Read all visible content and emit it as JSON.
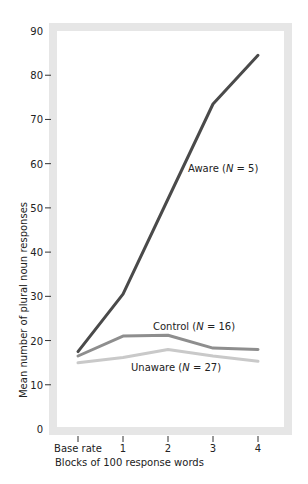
{
  "chart_data": {
    "type": "line",
    "title": "",
    "xlabel": "Blocks of 100 response words",
    "ylabel": "Mean number of plural noun responses",
    "categories": [
      "Base rate",
      "1",
      "2",
      "3",
      "4"
    ],
    "yticks": [
      0,
      10,
      20,
      30,
      40,
      50,
      60,
      70,
      80,
      90
    ],
    "ylim": [
      0,
      90
    ],
    "grid": false,
    "legend": "inline labels",
    "series": [
      {
        "name": "Aware (N = 5)",
        "values": [
          17.5,
          30.5,
          52,
          73.5,
          84.5
        ],
        "color": "#4a4a4a"
      },
      {
        "name": "Control (N = 16)",
        "values": [
          16.5,
          21,
          21.2,
          18.3,
          18
        ],
        "color": "#8e8e8e"
      },
      {
        "name": "Unaware (N = 27)",
        "values": [
          15,
          16.2,
          18,
          16.5,
          15.3
        ],
        "color": "#c9c9c9"
      }
    ],
    "annotations": [
      {
        "text": "Aware (N = 5)",
        "near": "Aware line, between x=2 and x=3"
      },
      {
        "text": "Control (N = 16)",
        "near": "above Control line, x≈2"
      },
      {
        "text": "Unaware (N = 27)",
        "near": "below Unaware line, x≈2"
      }
    ]
  },
  "labels": {
    "aware_prefix": "Aware (",
    "aware_n": "N",
    "aware_suffix": " = 5)",
    "control_prefix": "Control (",
    "control_n": "N",
    "control_suffix": " = 16)",
    "unaware_prefix": "Unaware (",
    "unaware_n": "N",
    "unaware_suffix": " = 27)"
  }
}
